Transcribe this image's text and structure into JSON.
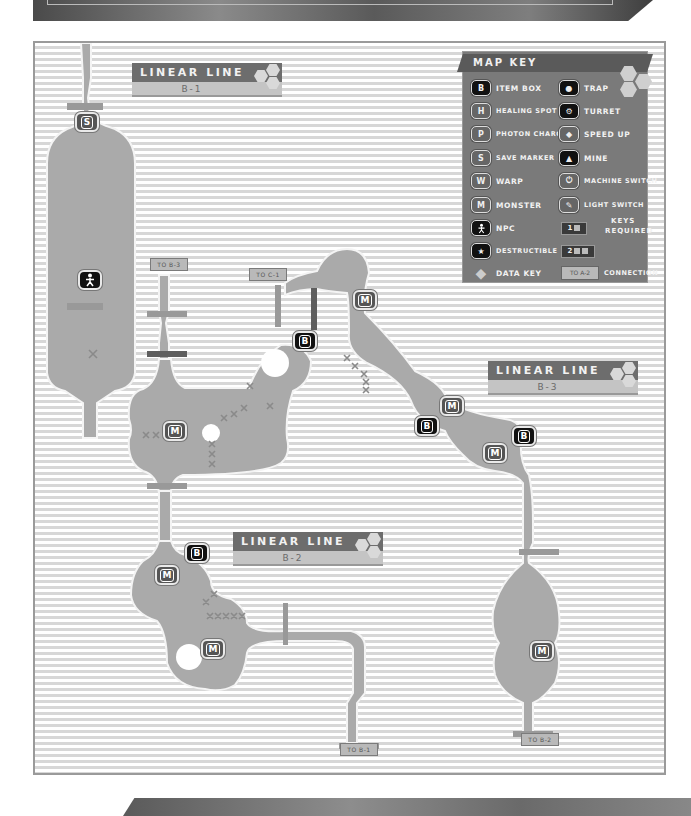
{
  "map": {
    "areas": [
      {
        "title": "LINEAR LINE",
        "subtitle": "B-1"
      },
      {
        "title": "LINEAR LINE",
        "subtitle": "B-2"
      },
      {
        "title": "LINEAR LINE",
        "subtitle": "B-3"
      }
    ],
    "connections": [
      {
        "label": "TO B-3"
      },
      {
        "label": "TO C-1"
      },
      {
        "label": "TO B-1"
      },
      {
        "label": "TO B-2"
      }
    ],
    "markers": {
      "save": "S",
      "box": "B",
      "monster": "M",
      "npc": "NPC"
    }
  },
  "map_key": {
    "title": "MAP KEY",
    "left": [
      {
        "icon": "B",
        "label": "Item Box"
      },
      {
        "icon": "H",
        "label": "Healing Spot"
      },
      {
        "icon": "P",
        "label": "Photon Charge"
      },
      {
        "icon": "S",
        "label": "Save Marker"
      },
      {
        "icon": "W",
        "label": "Warp"
      },
      {
        "icon": "M",
        "label": "Monster"
      },
      {
        "icon": "NPC",
        "label": "NPC"
      },
      {
        "icon": "★",
        "label": "Destructible"
      },
      {
        "icon": "◆",
        "label": "Data Key"
      }
    ],
    "right": [
      {
        "icon": "trap",
        "label": "Trap"
      },
      {
        "icon": "turret",
        "label": "Turret"
      },
      {
        "icon": "speed",
        "label": "Speed Up"
      },
      {
        "icon": "mine",
        "label": "Mine"
      },
      {
        "icon": "power",
        "label": "Machine Switch"
      },
      {
        "icon": "light",
        "label": "Light Switch"
      }
    ],
    "keys_required": {
      "one": "1",
      "two": "2",
      "label_line1": "Keys",
      "label_line2": "Required"
    },
    "connection": {
      "example": "TO A-2",
      "label": "Connection"
    }
  },
  "colors": {
    "room_fill": "#aaaaaa",
    "stripe_light": "#ffffff",
    "stripe_dark": "#d7d7d7",
    "door_light": "#999999",
    "door_dark": "#5e5e5e",
    "key_bg": "#7a7a7a"
  }
}
